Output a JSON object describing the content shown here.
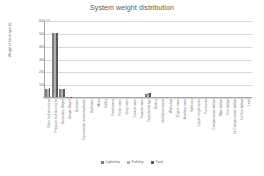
{
  "chart_data": {
    "type": "bar",
    "title": "System weight distribution",
    "xlabel": "",
    "ylabel": "Weight of block type (t)",
    "ylim": [
      0,
      600
    ],
    "ytick_labels": [
      "600.00",
      "500.00",
      "400.00",
      "300.00",
      "200.00",
      "100.00",
      "0.00"
    ],
    "ytick_values": [
      600,
      500,
      400,
      300,
      200,
      100,
      0
    ],
    "grid": true,
    "legend_position": "bottom",
    "categories": [
      "Outer hull structures",
      "Pressure hull structures",
      "Secondary Object",
      "Simple Object",
      "Bedroom",
      "Commander accommodation",
      "Bathroom",
      "Mess",
      "Galley",
      "Food stores",
      "Fresh water",
      "Grey water",
      "Control room",
      "Torpedo room",
      "Torpedo storage",
      "Battery",
      "Ventilation stores",
      "Workshop",
      "Engine room",
      "Auxiliary room",
      "Batteries",
      "Liquid weight tanks",
      "Fuel tanks",
      "Compensation ballast",
      "Main ballast",
      "Trim ballast",
      "Int Compensation ballast",
      "Int Trim ballast",
      "Lead"
    ],
    "series": [
      {
        "name": "Lightship",
        "color": "#7f7f7f",
        "values": [
          62,
          500,
          60,
          3,
          0,
          0,
          0,
          0,
          0,
          0,
          0,
          0,
          0,
          0,
          26,
          0,
          0,
          0,
          0,
          0,
          0,
          0,
          0,
          0,
          0,
          0,
          0,
          0,
          0
        ]
      },
      {
        "name": "Fullship",
        "color": "#b0b0b0",
        "values": [
          66,
          500,
          62,
          3,
          0,
          0,
          0,
          0,
          0,
          0,
          0,
          0,
          0,
          0,
          28,
          0,
          0,
          0,
          0,
          0,
          0,
          0,
          0,
          0,
          0,
          0,
          0,
          0,
          0
        ]
      },
      {
        "name": "Total",
        "color": "#595959",
        "values": [
          70,
          502,
          65,
          4,
          0,
          0,
          0,
          0,
          0,
          0,
          0,
          0,
          0,
          0,
          30,
          0,
          0,
          0,
          0,
          0,
          0,
          0,
          0,
          0,
          0,
          0,
          0,
          0,
          0
        ]
      }
    ]
  },
  "legend": {
    "items": [
      {
        "label": "Lightship",
        "color": "#7f7f7f"
      },
      {
        "label": "Fullship",
        "color": "#b0b0b0"
      },
      {
        "label": "Total",
        "color": "#595959"
      }
    ]
  }
}
